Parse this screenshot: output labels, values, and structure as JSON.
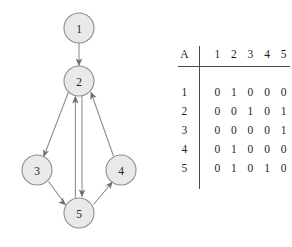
{
  "figure": {
    "graph": {
      "title": "directed graph",
      "nodes": [
        {
          "id": "1",
          "label": "1",
          "cx": 79,
          "cy": 28
        },
        {
          "id": "2",
          "label": "2",
          "cx": 79,
          "cy": 81
        },
        {
          "id": "3",
          "label": "3",
          "cx": 37,
          "cy": 170
        },
        {
          "id": "4",
          "label": "4",
          "cx": 121,
          "cy": 170
        },
        {
          "id": "5",
          "label": "5",
          "cx": 79,
          "cy": 213
        }
      ],
      "node_radius": 15,
      "node_fill": "#e9e9e9",
      "node_stroke": "#8d8d8d",
      "edge_color": "#8a8a8a",
      "arrow_color": "#6f6f6f",
      "edges": [
        {
          "from": "1",
          "to": "2",
          "directed": true
        },
        {
          "from": "2",
          "to": "3",
          "directed": true
        },
        {
          "from": "2",
          "to": "5",
          "directed": true
        },
        {
          "from": "3",
          "to": "5",
          "directed": true
        },
        {
          "from": "5",
          "to": "2",
          "directed": true
        },
        {
          "from": "5",
          "to": "4",
          "directed": true
        },
        {
          "from": "4",
          "to": "2",
          "directed": true
        }
      ]
    },
    "matrix": {
      "name": "A",
      "col_headers": [
        "1",
        "2",
        "3",
        "4",
        "5"
      ],
      "row_headers": [
        "1",
        "2",
        "3",
        "4",
        "5"
      ],
      "rows": [
        [
          "0",
          "1",
          "0",
          "0",
          "0"
        ],
        [
          "0",
          "0",
          "1",
          "0",
          "1"
        ],
        [
          "0",
          "0",
          "0",
          "0",
          "1"
        ],
        [
          "0",
          "1",
          "0",
          "0",
          "0"
        ],
        [
          "0",
          "1",
          "0",
          "1",
          "0"
        ]
      ]
    }
  }
}
